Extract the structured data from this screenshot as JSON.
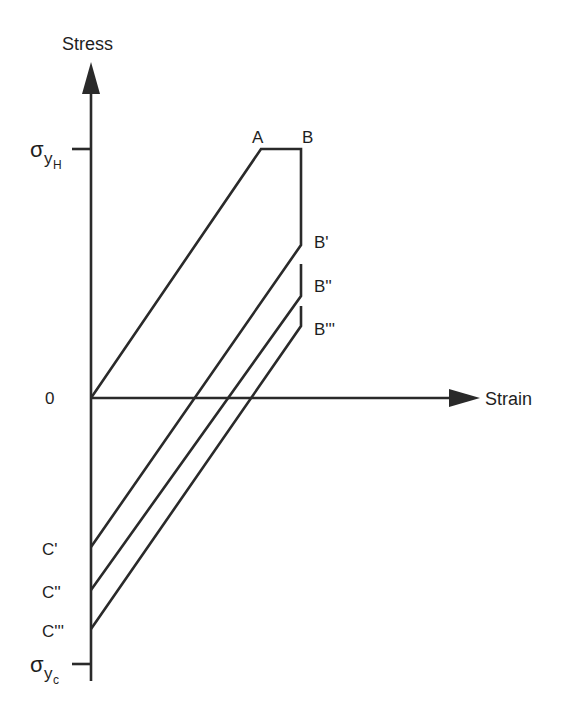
{
  "diagram": {
    "y_axis_label": "Stress",
    "x_axis_label": "Strain",
    "origin_label": "0",
    "sigma_symbol": "σ",
    "sigma_y_sub": "y",
    "top_tick_sub": "H",
    "bottom_tick_sub": "c",
    "point_labels": {
      "A": "A",
      "B": "B",
      "B1": "B'",
      "B2": "B''",
      "B3": "B'''",
      "C1": "C'",
      "C2": "C''",
      "C3": "C'''"
    },
    "line_color": "#2a2a2a"
  }
}
